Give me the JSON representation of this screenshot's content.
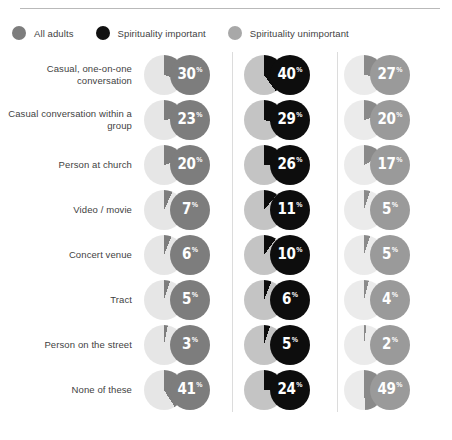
{
  "legend": {
    "items": [
      {
        "label": "All adults",
        "color": "#7d7d7d"
      },
      {
        "label": "Spirituality important",
        "color": "#111111"
      },
      {
        "label": "Spirituality unimportant",
        "color": "#a8a8a8"
      }
    ]
  },
  "palette": {
    "col1_wedge": "#7d7d7d",
    "col1_base": "#e6e6e6",
    "col1_badge": "#7d7d7d",
    "col2_wedge": "#0d0d0d",
    "col2_base": "#c4c4c4",
    "col2_badge": "#0d0d0d",
    "col3_wedge": "#8a8a8a",
    "col3_base": "#ebebeb",
    "col3_badge": "#9a9a9a",
    "divider": "#dcdcdc",
    "rule": "#b9b9b9",
    "text": "#3f3f3f"
  },
  "percent_symbol": "%",
  "chart_data": {
    "type": "pie",
    "title": "",
    "subtitle": "",
    "xlabel": "",
    "ylabel": "",
    "grid": false,
    "legend_position": "top-left",
    "layout": "small-multiples grid of pie charts, 8 rows by 3 columns",
    "pie_start_angle_deg": 0,
    "pie_direction": "clockwise",
    "units": "percent",
    "categories": [
      "Casual, one-on-one conversation",
      "Casual conversation within a group",
      "Person at church",
      "Video / movie",
      "Concert venue",
      "Tract",
      "Person on the street",
      "None of these"
    ],
    "series": [
      {
        "name": "All adults",
        "values": [
          30,
          23,
          20,
          7,
          6,
          5,
          3,
          41
        ]
      },
      {
        "name": "Spirituality important",
        "values": [
          40,
          29,
          26,
          11,
          10,
          6,
          5,
          24
        ]
      },
      {
        "name": "Spirituality unimportant",
        "values": [
          27,
          20,
          17,
          5,
          5,
          4,
          2,
          49
        ]
      }
    ]
  }
}
